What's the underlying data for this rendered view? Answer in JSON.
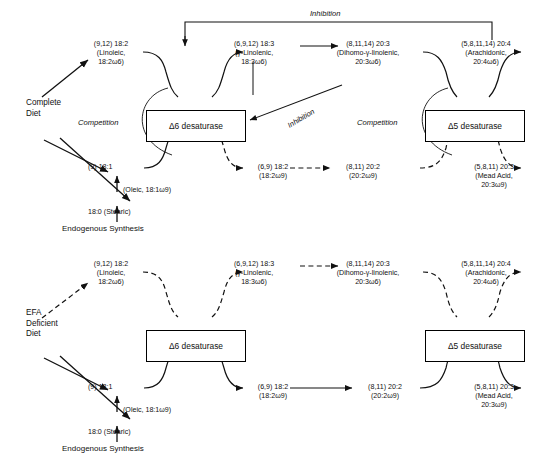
{
  "figure": {
    "type": "biochemical-pathway-diagram"
  },
  "panels": [
    {
      "id": "complete-diet",
      "diet_label": [
        "Complete",
        "Diet"
      ],
      "omega6_row": {
        "style": "solid",
        "nodes": [
          {
            "id": "linoleic",
            "l1": "(9,12) 18:2",
            "l2": "(Linoleic,",
            "l3": "18:2ω6)"
          },
          {
            "id": "g-linolenic",
            "l1": "(6,9,12) 18:3",
            "l2": "(γ-Linolenic,",
            "l3": "18:3ω6)"
          },
          {
            "id": "dgla",
            "l1": "(8,11,14) 20:3",
            "l2": "(Dihomo-γ-linolenic,",
            "l3": "20:3ω6)"
          },
          {
            "id": "arachidonic",
            "l1": "(5,8,11,14) 20:4",
            "l2": "(Arachidonic,",
            "l3": "20:4ω6)"
          }
        ]
      },
      "omega9_row": {
        "style": "mixed",
        "nodes": [
          {
            "id": "oleic",
            "l1": "(9) 18:1",
            "l2": "(Oleic, 18:1ω9)",
            "l3": ""
          },
          {
            "id": "18-2w9",
            "l1": "(6,9) 18:2",
            "l2": "(18:2ω9)",
            "l3": ""
          },
          {
            "id": "20-2w9",
            "l1": "(8,11) 20:2",
            "l2": "(20:2ω9)",
            "l3": ""
          },
          {
            "id": "mead",
            "l1": "(5,8,11) 20:3",
            "l2": "(Mead Acid,",
            "l3": "20:3ω9)"
          }
        ]
      },
      "stearic": "18:0  (Stearic)",
      "endogenous": "Endogenous Synthesis",
      "enzymes": [
        {
          "id": "d6",
          "label": "Δ6 desaturase"
        },
        {
          "id": "d5",
          "label": "Δ5 desaturase"
        }
      ],
      "annotations": {
        "competition_d6": "Competition",
        "competition_d5": "Competition",
        "inhibition_top": "Inhibition",
        "inhibition_diag": "Inhibition"
      }
    },
    {
      "id": "efa-deficient-diet",
      "diet_label": [
        "EFA",
        "Deficient",
        "Diet"
      ],
      "omega6_row": {
        "style": "dashed",
        "nodes": [
          {
            "id": "linoleic",
            "l1": "(9,12) 18:2",
            "l2": "(Linoleic,",
            "l3": "18:2ω6)"
          },
          {
            "id": "g-linolenic",
            "l1": "(6,9,12) 18:3",
            "l2": "(γ-Linolenic,",
            "l3": "18:3ω6)"
          },
          {
            "id": "dgla",
            "l1": "(8,11,14) 20:3",
            "l2": "(Dihomo-γ-linolenic,",
            "l3": "20:3ω6)"
          },
          {
            "id": "arachidonic",
            "l1": "(5,8,11,14) 20:4",
            "l2": "(Arachidonic,",
            "l3": "20:4ω6)"
          }
        ]
      },
      "omega9_row": {
        "style": "solid",
        "nodes": [
          {
            "id": "oleic",
            "l1": "(9) 18:1",
            "l2": "(Oleic, 18:1ω9)",
            "l3": ""
          },
          {
            "id": "18-2w9",
            "l1": "(6,9) 18:2",
            "l2": "(18:2ω9)",
            "l3": ""
          },
          {
            "id": "20-2w9",
            "l1": "(8,11) 20:2",
            "l2": "(20:2ω9)",
            "l3": ""
          },
          {
            "id": "mead",
            "l1": "(5,8,11) 20:3",
            "l2": "(Mead Acid,",
            "l3": "20:3ω9)"
          }
        ]
      },
      "stearic": "18:0  (Stearic)",
      "endogenous": "Endogenous Synthesis",
      "enzymes": [
        {
          "id": "d6",
          "label": "Δ6 desaturase"
        },
        {
          "id": "d5",
          "label": "Δ5 desaturase"
        }
      ],
      "annotations": {}
    }
  ],
  "colors": {
    "ink": "#111111",
    "background": "#ffffff"
  }
}
